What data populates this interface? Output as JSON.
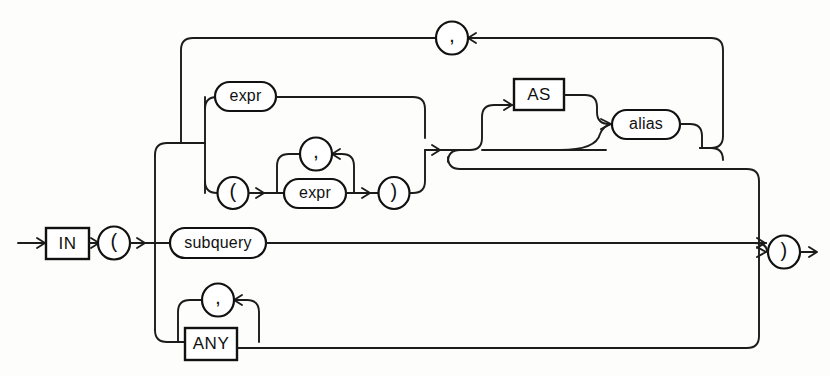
{
  "diagram": {
    "type": "railroad-syntax-diagram",
    "stroke_color": "#111111",
    "background_color": "#fdfdfc",
    "nodes": {
      "in_keyword": {
        "label": "IN",
        "shape": "box",
        "kind": "keyword"
      },
      "open_paren": {
        "label": "(",
        "shape": "circle",
        "kind": "punctuation"
      },
      "close_paren": {
        "label": ")",
        "shape": "circle",
        "kind": "punctuation"
      },
      "expr_top": {
        "label": "expr",
        "shape": "oval",
        "kind": "nonterminal"
      },
      "expr_inner": {
        "label": "expr",
        "shape": "oval",
        "kind": "nonterminal"
      },
      "inner_open_paren": {
        "label": "(",
        "shape": "circle",
        "kind": "punctuation"
      },
      "inner_close_paren": {
        "label": ")",
        "shape": "circle",
        "kind": "punctuation"
      },
      "comma_top": {
        "label": ",",
        "shape": "circle",
        "kind": "punctuation"
      },
      "comma_inner": {
        "label": ",",
        "shape": "circle",
        "kind": "punctuation"
      },
      "comma_any": {
        "label": ",",
        "shape": "circle",
        "kind": "punctuation"
      },
      "as_keyword": {
        "label": "AS",
        "shape": "box",
        "kind": "keyword"
      },
      "alias_node": {
        "label": "alias",
        "shape": "oval",
        "kind": "nonterminal"
      },
      "subquery_node": {
        "label": "subquery",
        "shape": "oval",
        "kind": "nonterminal"
      },
      "any_keyword": {
        "label": "ANY",
        "shape": "box",
        "kind": "keyword"
      }
    }
  }
}
